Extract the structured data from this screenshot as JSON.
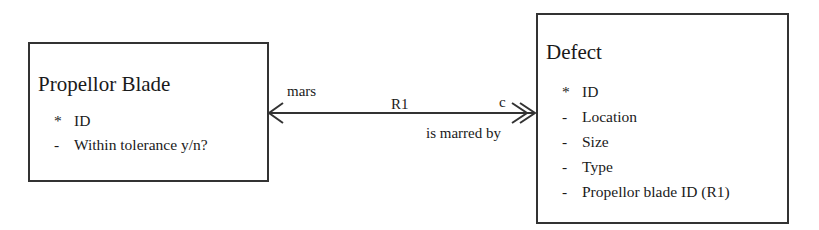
{
  "entities": {
    "left": {
      "title": "Propellor Blade",
      "attributes": [
        {
          "mark": "*",
          "name": "ID"
        },
        {
          "mark": "-",
          "name": "Within tolerance y/n?"
        }
      ]
    },
    "right": {
      "title": "Defect",
      "attributes": [
        {
          "mark": "*",
          "name": "ID"
        },
        {
          "mark": "-",
          "name": "Location"
        },
        {
          "mark": "-",
          "name": "Size"
        },
        {
          "mark": "-",
          "name": "Type"
        },
        {
          "mark": "-",
          "name": "Propellor blade ID (R1)"
        }
      ]
    }
  },
  "relationship": {
    "id": "R1",
    "forward_phrase": "mars",
    "reverse_phrase": "is marred by",
    "multiplicity_right": "c"
  },
  "colors": {
    "line": "#333333",
    "text": "#1a1a1a"
  }
}
